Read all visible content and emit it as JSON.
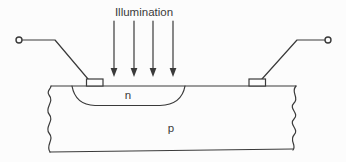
{
  "diagram": {
    "type": "photodiode-cross-section",
    "title_label": "Illumination",
    "illumination_arrow_count": 4,
    "regions": {
      "n_label": "n",
      "p_label": "p"
    },
    "colors": {
      "line": "#3a3a3a",
      "background": "#fcfcfc"
    }
  }
}
